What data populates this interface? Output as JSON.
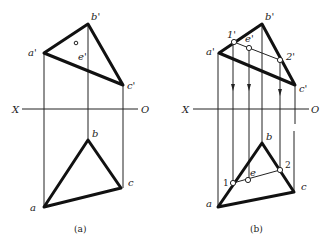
{
  "figures": [
    {
      "caption": "(a)",
      "axis": {
        "left": "X",
        "right": "O"
      },
      "labels": {
        "a_prime": "a'",
        "b_prime": "b'",
        "c_prime": "c'",
        "e_prime": "e'",
        "a": "a",
        "b": "b",
        "c": "c"
      }
    },
    {
      "caption": "(b)",
      "axis": {
        "left": "X",
        "right": "O"
      },
      "labels": {
        "a_prime": "a'",
        "b_prime": "b'",
        "c_prime": "c'",
        "e_prime": "e'",
        "one_prime": "1'",
        "two_prime": "2'",
        "a": "a",
        "b": "b",
        "c": "c",
        "e": "e",
        "one": "1",
        "two": "2"
      }
    }
  ]
}
